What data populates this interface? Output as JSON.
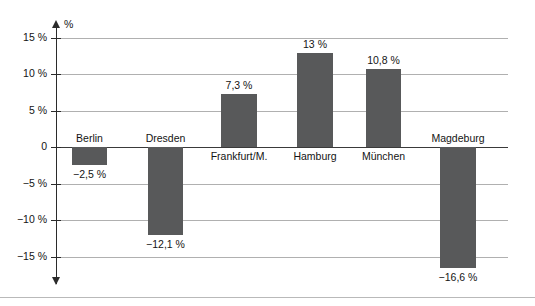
{
  "chart_data": {
    "type": "bar",
    "title": "",
    "xlabel": "",
    "ylabel": "%",
    "ylim": [
      -17.5,
      16.5
    ],
    "grid": true,
    "legend": "none",
    "axis_unit_label": "%",
    "y_ticks": [
      {
        "value": 15,
        "label": "15 %"
      },
      {
        "value": 10,
        "label": "10 %"
      },
      {
        "value": 5,
        "label": "5 %"
      },
      {
        "value": 0,
        "label": "0"
      },
      {
        "value": -5,
        "label": "−5 %"
      },
      {
        "value": -10,
        "label": "−10 %"
      },
      {
        "value": -15,
        "label": "−15 %"
      }
    ],
    "categories": [
      "Berlin",
      "Dresden",
      "Frankfurt/M.",
      "Hamburg",
      "München",
      "Magdeburg"
    ],
    "values": [
      -2.5,
      -12.1,
      7.3,
      13,
      10.8,
      -16.6
    ],
    "value_labels": [
      "−2,5 %",
      "−12,1 %",
      "7,3 %",
      "13 %",
      "10,8 %",
      "−16,6 %"
    ],
    "bars": [
      {
        "name": "Berlin",
        "value": -2.5,
        "value_label": "−2,5 %",
        "x": 72,
        "width": 35
      },
      {
        "name": "Dresden",
        "value": -12.1,
        "value_label": "−12,1 %",
        "x": 148,
        "width": 35
      },
      {
        "name": "Frankfurt/M.",
        "value": 7.3,
        "value_label": "7,3 %",
        "x": 221,
        "width": 36
      },
      {
        "name": "Hamburg",
        "value": 13,
        "value_label": "13 %",
        "x": 297,
        "width": 36
      },
      {
        "name": "München",
        "value": 10.8,
        "value_label": "10,8 %",
        "x": 366,
        "width": 35
      },
      {
        "name": "Magdeburg",
        "value": -16.6,
        "value_label": "−16,6 %",
        "x": 440,
        "width": 36
      }
    ],
    "colors": {
      "bar": "#58595a",
      "gridline": "#b0b0b0",
      "zero_line": "#3a3a3a",
      "axis": "#2b2b2b",
      "text": "#141414",
      "background": "#ffffff"
    }
  }
}
